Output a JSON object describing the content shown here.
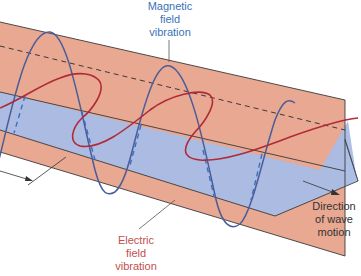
{
  "figure": {
    "type": "electromagnetic-wave-diagram",
    "colors": {
      "red_plane": "#e8a891",
      "blue_plane": "#a9bce6",
      "magnetic_wave": "#4a5c9a",
      "electric_wave": "#b02a37",
      "magnetic_label": "#3a72b8",
      "electric_label": "#c0504d",
      "outline": "#3a3a3a"
    }
  },
  "labels": {
    "magnetic": {
      "lines": [
        "Magnetic",
        "field",
        "vibration"
      ]
    },
    "electric": {
      "lines": [
        "Electric",
        "field",
        "vibration"
      ]
    },
    "direction": {
      "lines": [
        "Direction",
        "of wave",
        "motion"
      ]
    }
  }
}
